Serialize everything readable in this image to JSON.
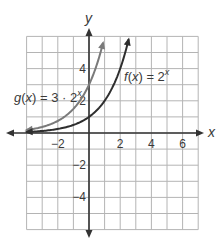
{
  "chart_data": {
    "type": "line",
    "title": "",
    "xlabel": "x",
    "ylabel": "y",
    "xlim": [
      -4,
      7
    ],
    "ylim": [
      -6,
      6
    ],
    "grid": true,
    "grid_step": 1,
    "x_ticks": [
      {
        "value": -2,
        "label": "−2"
      },
      {
        "value": 2,
        "label": "2"
      },
      {
        "value": 4,
        "label": "4"
      },
      {
        "value": 6,
        "label": "6"
      }
    ],
    "y_ticks": [
      {
        "value": 4,
        "label": "4"
      },
      {
        "value": 2,
        "label": "2"
      },
      {
        "value": -2,
        "label": "−2"
      },
      {
        "value": -4,
        "label": "−4"
      }
    ],
    "series": [
      {
        "name": "g(x) = 3·2^x",
        "label_parts": {
          "fn": "g",
          "var": "x",
          "eq": " = 3 · 2",
          "exp": "x"
        },
        "formula": "3*2^x",
        "color": "#7a7a7a",
        "x_range": [
          -4,
          0.9
        ],
        "y_intercept": 3,
        "points": [
          [
            -4,
            0.1875
          ],
          [
            -3,
            0.375
          ],
          [
            -2,
            0.75
          ],
          [
            -1,
            1.5
          ],
          [
            0,
            3
          ],
          [
            0.5,
            4.24
          ],
          [
            0.9,
            5.6
          ]
        ]
      },
      {
        "name": "f(x) = 2^x",
        "label_parts": {
          "fn": "f",
          "var": "x",
          "eq": " = 2",
          "exp": "x"
        },
        "formula": "2^x",
        "color": "#2e2e2e",
        "x_range": [
          -4,
          2.54
        ],
        "y_intercept": 1,
        "points": [
          [
            -4,
            0.0625
          ],
          [
            -3,
            0.125
          ],
          [
            -2,
            0.25
          ],
          [
            -1,
            0.5
          ],
          [
            0,
            1
          ],
          [
            1,
            2
          ],
          [
            2,
            4
          ],
          [
            2.54,
            5.8
          ]
        ]
      }
    ],
    "annotations": [
      {
        "text": "g(x) = 3·2^x",
        "near": [
          -3.5,
          2.6
        ]
      },
      {
        "text": "f(x) = 2^x",
        "near": [
          2.5,
          3.8
        ]
      }
    ]
  },
  "colors": {
    "grid": "#b4b4b4",
    "axes": "#333333",
    "text": "#3a3a3a"
  }
}
